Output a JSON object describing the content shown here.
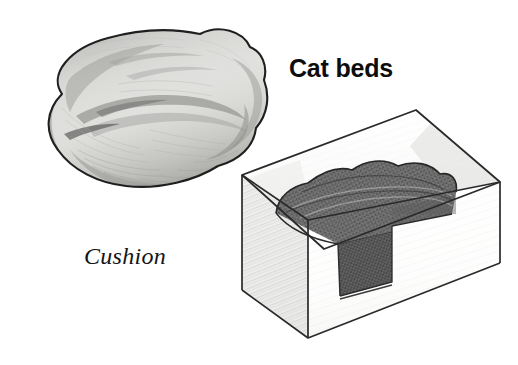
{
  "figure": {
    "title_label": "Cat beds",
    "items": [
      {
        "name": "cushion",
        "label": "Cushion",
        "label_style": "italic-serif",
        "description": "soft round pet cushion, pencil drawing"
      },
      {
        "name": "cardboard-box-bed",
        "label": "",
        "description": "open cardboard box with folded blanket inside"
      }
    ],
    "colors": {
      "background": "#ffffff",
      "ink": "#1a1a1a",
      "cushion_fill": "#f2f2f0",
      "cushion_shade": "#9a9a98",
      "box_face_light": "#fbfbfb",
      "box_face_shade": "#d8d8d6",
      "blanket_dark": "#6a6a6a",
      "blanket_darker": "#454545",
      "label_color": "#0d0d0d"
    }
  }
}
